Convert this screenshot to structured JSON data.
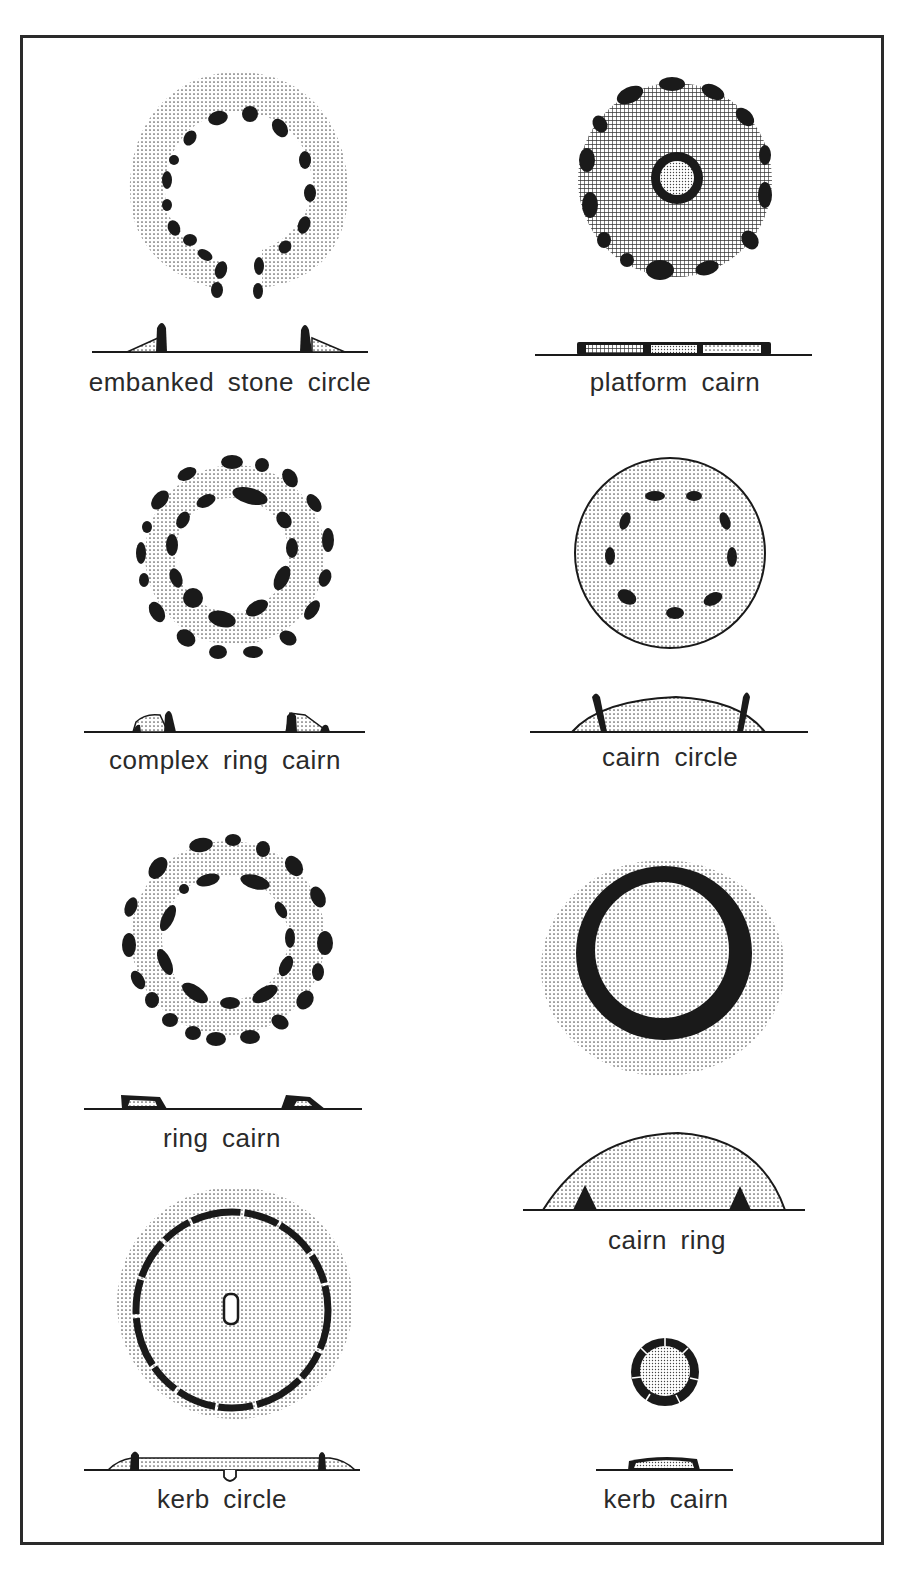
{
  "figure": {
    "type": "typology of prehistoric stone/cairn monuments — plan and section views",
    "layout": {
      "columns": 2,
      "rows": 4
    },
    "colors": {
      "ink": "#1a1a1a",
      "stipple": "#b8b8b8",
      "background": "#ffffff"
    },
    "panels": [
      {
        "id": "embanked-stone-circle",
        "label": "embanked stone circle",
        "column": 0,
        "row": 0,
        "plan": "ring of upright stones set in a stippled bank with an entrance gap at the bottom",
        "section": "two upright stones with sloping bank on outer sides"
      },
      {
        "id": "platform-cairn",
        "label": "platform cairn",
        "column": 1,
        "row": 0,
        "plan": "flat cross-hatched platform with peripheral kerb stones and a small central stone ring",
        "section": "low flat platform"
      },
      {
        "id": "complex-ring-cairn",
        "label": "complex ring cairn",
        "column": 0,
        "row": 1,
        "plan": "two concentric rings of stones with stippled bank between, open centre",
        "section": "two low banks each with upright stone"
      },
      {
        "id": "cairn-circle",
        "label": "cairn circle",
        "column": 1,
        "row": 1,
        "plan": "round stippled cairn with ring of stones set within it",
        "section": "low domed mound with stones protruding"
      },
      {
        "id": "ring-cairn",
        "label": "ring cairn",
        "column": 0,
        "row": 2,
        "plan": "ring bank faced by inner and outer stone kerbs, open centre",
        "section": "two low banks with kerb stones"
      },
      {
        "id": "cairn-ring",
        "label": "cairn ring",
        "column": 1,
        "row": 2,
        "plan": "solid dark ring of stones buried within a larger stippled cairn",
        "section": "high domed mound enclosing stone ring"
      },
      {
        "id": "kerb-circle",
        "label": "kerb circle",
        "column": 0,
        "row": 3,
        "plan": "large stippled area with continuous kerb and small central cist",
        "section": "low flat mound with kerb and central pit"
      },
      {
        "id": "kerb-cairn",
        "label": "kerb cairn",
        "column": 1,
        "row": 3,
        "plan": "small stippled cairn surrounded by contiguous kerb stones",
        "section": "small low mound with kerb"
      }
    ]
  }
}
